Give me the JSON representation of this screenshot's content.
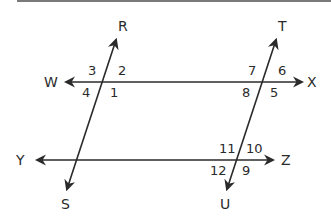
{
  "diagram": {
    "colors": {
      "line": "#2a2a2a",
      "top_rule": "#7a7a7a",
      "background": "#ffffff"
    },
    "points": {
      "R": "R",
      "S": "S",
      "T": "T",
      "U": "U",
      "W": "W",
      "X": "X",
      "Y": "Y",
      "Z": "Z"
    },
    "lines": [
      {
        "name": "WX",
        "from": "W",
        "to": "X",
        "type": "line"
      },
      {
        "name": "YZ",
        "from": "Y",
        "to": "Z",
        "type": "line"
      },
      {
        "name": "RS",
        "from": "R",
        "to": "S",
        "type": "transversal"
      },
      {
        "name": "TU",
        "from": "T",
        "to": "U",
        "type": "transversal"
      }
    ],
    "angles": {
      "a1": "1",
      "a2": "2",
      "a3": "3",
      "a4": "4",
      "a5": "5",
      "a6": "6",
      "a7": "7",
      "a8": "8",
      "a9": "9",
      "a10": "10",
      "a11": "11",
      "a12": "12"
    },
    "intersections": [
      {
        "lines": [
          "WX",
          "RS"
        ],
        "angles": [
          "1",
          "2",
          "3",
          "4"
        ]
      },
      {
        "lines": [
          "WX",
          "TU"
        ],
        "angles": [
          "5",
          "6",
          "7",
          "8"
        ]
      },
      {
        "lines": [
          "YZ",
          "TU"
        ],
        "angles": [
          "9",
          "10",
          "11",
          "12"
        ]
      },
      {
        "lines": [
          "YZ",
          "RS"
        ],
        "angles": []
      }
    ]
  }
}
